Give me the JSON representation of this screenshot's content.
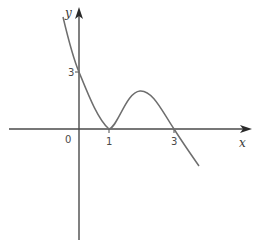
{
  "diagram": {
    "type": "function-sketch",
    "axes": {
      "x_label": "x",
      "y_label": "y",
      "origin_label": "0"
    },
    "ticks": {
      "x": [
        {
          "value": 1,
          "label": "1"
        },
        {
          "value": 3,
          "label": "3"
        }
      ],
      "y": [
        {
          "value": 3,
          "label": "3"
        }
      ]
    },
    "curve": {
      "description": "cubic-like curve: y-intercept 3, touches x-axis at x=1, local max between 1 and 3, crosses x-axis at x=3",
      "key_points": [
        {
          "x": 0,
          "y": 3,
          "note": "y-intercept"
        },
        {
          "x": 1,
          "y": 0,
          "note": "touches x-axis (local min)"
        },
        {
          "x": 3,
          "y": 0,
          "note": "crosses x-axis"
        }
      ],
      "color": "#6e6e6e"
    }
  }
}
